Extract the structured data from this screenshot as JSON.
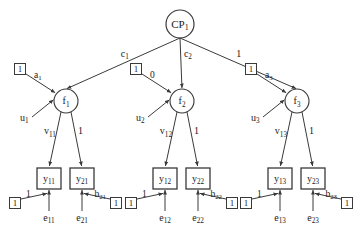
{
  "diagram": {
    "type": "path-diagram",
    "colors": {
      "stroke": "#3a3a3a",
      "text": "#1a1a1a",
      "background": "#ffffff"
    },
    "top_node": {
      "id": "CP1",
      "label": "CP",
      "sub": "1",
      "shape": "circle",
      "cx": 180,
      "cy": 24,
      "r": 14
    },
    "factors": [
      {
        "id": "f1",
        "label": "f",
        "sub": "1",
        "shape": "circle",
        "cx": 66,
        "cy": 101,
        "r": 12,
        "top_path_label": "c",
        "top_path_sub": "1",
        "const_label": "1",
        "loading_label": "a",
        "loading_sub": "1",
        "residual_label": "u",
        "residual_sub": "1",
        "left_load_label": "v",
        "left_load_sub": "11",
        "right_load_label": "1"
      },
      {
        "id": "f2",
        "label": "f",
        "sub": "2",
        "shape": "circle",
        "cx": 182,
        "cy": 101,
        "r": 12,
        "top_path_label": "c",
        "top_path_sub": "2",
        "const_label": "1",
        "loading_label": "0",
        "loading_sub": "",
        "residual_label": "u",
        "residual_sub": "2",
        "left_load_label": "v",
        "left_load_sub": "12",
        "right_load_label": "1"
      },
      {
        "id": "f3",
        "label": "f",
        "sub": "3",
        "shape": "circle",
        "cx": 297,
        "cy": 101,
        "r": 12,
        "top_path_label": "1",
        "top_path_sub": "",
        "const_label": "1",
        "loading_label": "a",
        "loading_sub": "3",
        "residual_label": "u",
        "residual_sub": "3",
        "left_load_label": "v",
        "left_load_sub": "13",
        "right_load_label": "1"
      }
    ],
    "indicators": [
      {
        "id": "y11",
        "label": "y",
        "sub": "11",
        "shape": "rect",
        "x": 37,
        "y": 168,
        "w": 24,
        "h": 21,
        "error_label": "e",
        "error_sub": "11",
        "error_path_label": "1",
        "error_const_label": "1"
      },
      {
        "id": "y21",
        "label": "y",
        "sub": "21",
        "shape": "rect",
        "x": 70,
        "y": 168,
        "w": 24,
        "h": 21,
        "error_label": "e",
        "error_sub": "21",
        "error_path_label": "b",
        "error_path_sub": "21",
        "error_const_label": "1"
      },
      {
        "id": "y12",
        "label": "y",
        "sub": "12",
        "shape": "rect",
        "x": 153,
        "y": 168,
        "w": 24,
        "h": 21,
        "error_label": "e",
        "error_sub": "12",
        "error_path_label": "1",
        "error_const_label": "1"
      },
      {
        "id": "y22",
        "label": "y",
        "sub": "22",
        "shape": "rect",
        "x": 186,
        "y": 168,
        "w": 24,
        "h": 21,
        "error_label": "e",
        "error_sub": "22",
        "error_path_label": "b",
        "error_path_sub": "22",
        "error_const_label": "1"
      },
      {
        "id": "y13",
        "label": "y",
        "sub": "13",
        "shape": "rect",
        "x": 268,
        "y": 168,
        "w": 24,
        "h": 21,
        "error_label": "e",
        "error_sub": "13",
        "error_path_label": "1",
        "error_const_label": "1"
      },
      {
        "id": "y23",
        "label": "y",
        "sub": "23",
        "shape": "rect",
        "x": 301,
        "y": 168,
        "w": 24,
        "h": 21,
        "error_label": "e",
        "error_sub": "23",
        "error_path_label": "b",
        "error_path_sub": "23",
        "error_const_label": "1"
      }
    ]
  }
}
